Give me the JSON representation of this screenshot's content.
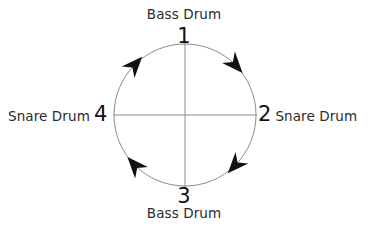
{
  "diagram": {
    "circle": {
      "center_x": 185,
      "center_y": 115,
      "radius": 71,
      "stroke_color": "#8c8c8c",
      "stroke_width": 1
    },
    "crosshair": {
      "stroke_color": "#8c8c8c",
      "stroke_width": 1,
      "vertical_top_y": 41,
      "vertical_bottom_y": 188,
      "horizontal_left_x": 113,
      "horizontal_right_x": 257
    },
    "arrow_color": "#111111",
    "direction": "clockwise",
    "arrows": [
      {
        "name": "arrow-top-right",
        "angle_deg": 45,
        "position": "upper-right"
      },
      {
        "name": "arrow-bottom-right",
        "angle_deg": 135,
        "position": "lower-right"
      },
      {
        "name": "arrow-bottom-left",
        "angle_deg": 225,
        "position": "lower-left"
      },
      {
        "name": "arrow-top-left",
        "angle_deg": 315,
        "position": "upper-left"
      }
    ],
    "beats": [
      {
        "number": "1",
        "label": "Bass Drum",
        "position": "top"
      },
      {
        "number": "2",
        "label": "Snare Drum",
        "position": "right"
      },
      {
        "number": "3",
        "label": "Bass Drum",
        "position": "bottom"
      },
      {
        "number": "4",
        "label": "Snare Drum",
        "position": "left"
      }
    ]
  }
}
